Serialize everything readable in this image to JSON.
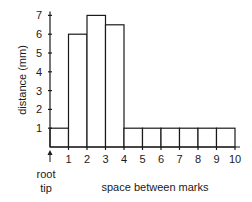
{
  "chart_data": {
    "type": "bar",
    "title": "",
    "xlabel": "space between marks",
    "ylabel": "distance (mm)",
    "origin_label": [
      "root",
      "tip"
    ],
    "categories": [
      "0-1",
      "1-2",
      "2-3",
      "3-4",
      "4-5",
      "5-6",
      "6-7",
      "7-8",
      "8-9",
      "9-10"
    ],
    "values": [
      1,
      6,
      7,
      6.5,
      1,
      1,
      1,
      1,
      1,
      1
    ],
    "x_ticks": [
      "1",
      "2",
      "3",
      "4",
      "5",
      "6",
      "7",
      "8",
      "9",
      "10"
    ],
    "y_ticks": [
      "1",
      "2",
      "3",
      "4",
      "5",
      "6",
      "7"
    ],
    "ylim": [
      0,
      7
    ],
    "xlim": [
      0,
      10
    ],
    "grid": false,
    "legend": null,
    "colors": {
      "bar_fill": "#ffffff",
      "bar_stroke": "#1a1a1a",
      "axis": "#1a1a1a"
    }
  }
}
